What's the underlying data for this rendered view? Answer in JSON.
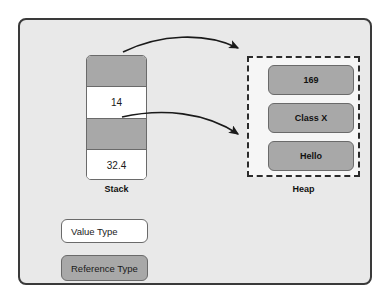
{
  "diagram": {
    "colors": {
      "panel_background": "#e9e9e9",
      "panel_border": "#3a3a3a",
      "reference_fill": "#a8a8a8",
      "value_fill": "#ffffff",
      "cell_border": "#6a6a6a",
      "heap_border": "#2b2b2b",
      "arrow": "#1a1a1a"
    }
  },
  "stack": {
    "label": "Stack",
    "cells": [
      {
        "value": "",
        "kind": "reference"
      },
      {
        "value": "14",
        "kind": "value"
      },
      {
        "value": "",
        "kind": "reference"
      },
      {
        "value": "32.4",
        "kind": "value"
      }
    ]
  },
  "heap": {
    "label": "Heap",
    "boxes": [
      {
        "value": "169"
      },
      {
        "value": "Class X"
      },
      {
        "value": "Hello"
      }
    ]
  },
  "arrows": [
    {
      "from": "stack-cell-0",
      "to": "heap-box-169"
    },
    {
      "from": "stack-cell-2",
      "to": "heap-box-hello"
    }
  ],
  "legend": {
    "value_type": "Value Type",
    "reference_type": "Reference Type"
  }
}
